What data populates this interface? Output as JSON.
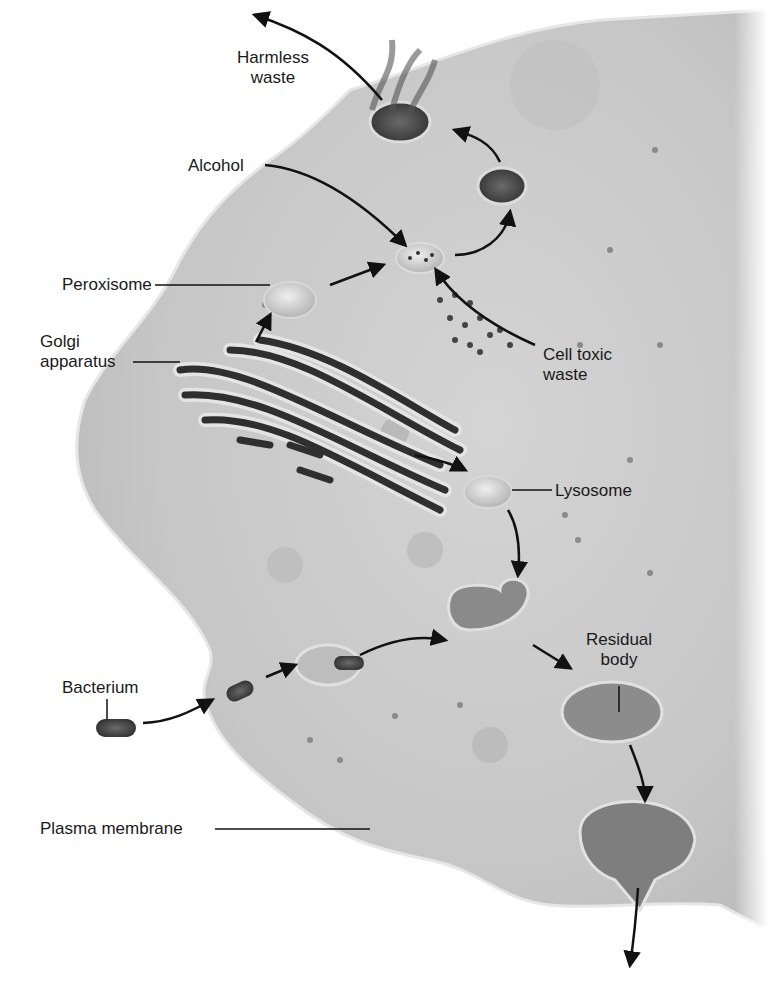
{
  "figure": {
    "colors": {
      "background": "#ffffff",
      "cytoplasm": "#c9c9c9",
      "cytoplasm_light": "#d8d8d8",
      "membrane_edge": "#e9e9e9",
      "organelle_dark": "#3a3a3a",
      "arrow": "#111111",
      "label_text": "#1a1a1a"
    }
  },
  "labels": {
    "harmless_waste_1": "Harmless",
    "harmless_waste_2": "waste",
    "alcohol": "Alcohol",
    "peroxisome": "Peroxisome",
    "golgi_1": "Golgi",
    "golgi_2": "apparatus",
    "cell_toxic_waste_1": "Cell toxic",
    "cell_toxic_waste_2": "waste",
    "lysosome": "Lysosome",
    "residual_body_1": "Residual",
    "residual_body_2": "body",
    "bacterium": "Bacterium",
    "plasma_membrane": "Plasma membrane"
  }
}
